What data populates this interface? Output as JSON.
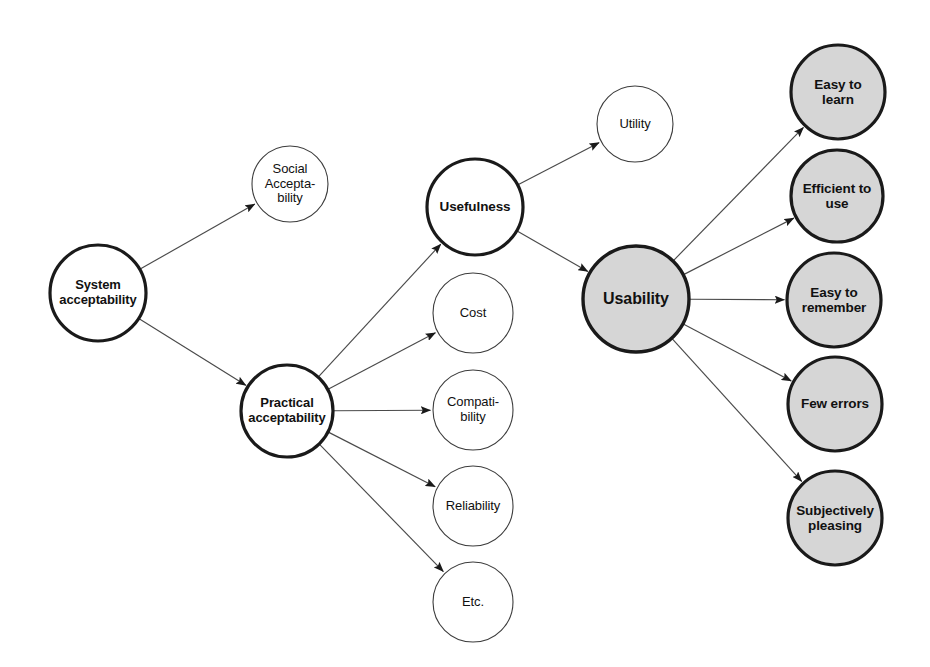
{
  "diagram": {
    "background_color": "#ffffff",
    "stroke_color": "#1a1a1a",
    "thin_stroke_color": "#3c3c3c",
    "gray_fill": "#d6d6d6",
    "white_fill": "#ffffff",
    "edge_color": "#4a4a4a",
    "nodes": [
      {
        "id": "system-acceptability",
        "label": "System\nacceptability",
        "cx": 98,
        "cy": 293,
        "r": 48,
        "fill": "#ffffff",
        "stroke_width": 3.2,
        "font_size": 13,
        "weight": "bold"
      },
      {
        "id": "social-acceptability",
        "label": "Social\nAccepta-\nbility",
        "cx": 290,
        "cy": 184,
        "r": 38,
        "fill": "#ffffff",
        "stroke_width": 1.1,
        "font_size": 13,
        "weight": "normal"
      },
      {
        "id": "practical-acceptability",
        "label": "Practical\nacceptability",
        "cx": 287,
        "cy": 411,
        "r": 46,
        "fill": "#ffffff",
        "stroke_width": 3.2,
        "font_size": 13,
        "weight": "bold"
      },
      {
        "id": "usefulness",
        "label": "Usefulness",
        "cx": 475,
        "cy": 207,
        "r": 48,
        "fill": "#ffffff",
        "stroke_width": 3.2,
        "font_size": 13.5,
        "weight": "bold"
      },
      {
        "id": "cost",
        "label": "Cost",
        "cx": 473,
        "cy": 313,
        "r": 40,
        "fill": "#ffffff",
        "stroke_width": 1.1,
        "font_size": 13,
        "weight": "normal"
      },
      {
        "id": "compatibility",
        "label": "Compati-\nbility",
        "cx": 473,
        "cy": 410,
        "r": 40,
        "fill": "#ffffff",
        "stroke_width": 1.1,
        "font_size": 13,
        "weight": "normal"
      },
      {
        "id": "reliability",
        "label": "Reliability",
        "cx": 473,
        "cy": 506,
        "r": 40,
        "fill": "#ffffff",
        "stroke_width": 1.1,
        "font_size": 13,
        "weight": "normal"
      },
      {
        "id": "etc",
        "label": "Etc.",
        "cx": 473,
        "cy": 602,
        "r": 40,
        "fill": "#ffffff",
        "stroke_width": 1.1,
        "font_size": 13,
        "weight": "normal"
      },
      {
        "id": "utility",
        "label": "Utility",
        "cx": 635,
        "cy": 124,
        "r": 38,
        "fill": "#ffffff",
        "stroke_width": 1.1,
        "font_size": 13,
        "weight": "normal"
      },
      {
        "id": "usability",
        "label": "Usability",
        "cx": 636,
        "cy": 299,
        "r": 53,
        "fill": "#d6d6d6",
        "stroke_width": 3.4,
        "font_size": 16,
        "weight": "bold"
      },
      {
        "id": "easy-to-learn",
        "label": "Easy to\nlearn",
        "cx": 838,
        "cy": 92,
        "r": 47,
        "fill": "#d6d6d6",
        "stroke_width": 3.2,
        "font_size": 13.5,
        "weight": "bold"
      },
      {
        "id": "efficient-to-use",
        "label": "Efficient to\nuse",
        "cx": 837,
        "cy": 196,
        "r": 46,
        "fill": "#d6d6d6",
        "stroke_width": 3.2,
        "font_size": 13.5,
        "weight": "bold"
      },
      {
        "id": "easy-to-remember",
        "label": "Easy to\nremember",
        "cx": 834,
        "cy": 300,
        "r": 47,
        "fill": "#d6d6d6",
        "stroke_width": 3.2,
        "font_size": 13.5,
        "weight": "bold"
      },
      {
        "id": "few-errors",
        "label": "Few errors",
        "cx": 835,
        "cy": 404,
        "r": 47,
        "fill": "#d6d6d6",
        "stroke_width": 3.2,
        "font_size": 13.5,
        "weight": "bold"
      },
      {
        "id": "subjectively-pleasing",
        "label": "Subjectively\npleasing",
        "cx": 835,
        "cy": 518,
        "r": 47,
        "fill": "#d6d6d6",
        "stroke_width": 3.2,
        "font_size": 13.5,
        "weight": "bold"
      }
    ],
    "edges": [
      {
        "id": "edge-system-social",
        "from": "system-acceptability",
        "to": "social-acceptability"
      },
      {
        "id": "edge-system-practical",
        "from": "system-acceptability",
        "to": "practical-acceptability"
      },
      {
        "id": "edge-practical-usefulness",
        "from": "practical-acceptability",
        "to": "usefulness"
      },
      {
        "id": "edge-practical-cost",
        "from": "practical-acceptability",
        "to": "cost"
      },
      {
        "id": "edge-practical-compatibility",
        "from": "practical-acceptability",
        "to": "compatibility"
      },
      {
        "id": "edge-practical-reliability",
        "from": "practical-acceptability",
        "to": "reliability"
      },
      {
        "id": "edge-practical-etc",
        "from": "practical-acceptability",
        "to": "etc"
      },
      {
        "id": "edge-usefulness-utility",
        "from": "usefulness",
        "to": "utility"
      },
      {
        "id": "edge-usefulness-usability",
        "from": "usefulness",
        "to": "usability"
      },
      {
        "id": "edge-usability-easy-to-learn",
        "from": "usability",
        "to": "easy-to-learn"
      },
      {
        "id": "edge-usability-efficient-to-use",
        "from": "usability",
        "to": "efficient-to-use"
      },
      {
        "id": "edge-usability-easy-to-remember",
        "from": "usability",
        "to": "easy-to-remember"
      },
      {
        "id": "edge-usability-few-errors",
        "from": "usability",
        "to": "few-errors"
      },
      {
        "id": "edge-usability-subjectively-pleasing",
        "from": "usability",
        "to": "subjectively-pleasing"
      }
    ]
  }
}
